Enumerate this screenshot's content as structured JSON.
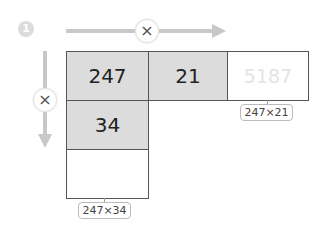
{
  "step_number": "1",
  "operator_symbol": "×",
  "grid": {
    "row1": [
      "247",
      "21",
      "5187"
    ],
    "row2": [
      "34"
    ],
    "row3": [
      ""
    ]
  },
  "labels": {
    "top_right": "247×21",
    "bottom_left": "247×34"
  },
  "colors": {
    "gray_cell": "#dcdcdc",
    "arrow": "#c8c8c8",
    "faint_text": "#e4e4e4",
    "border": "#555555"
  }
}
